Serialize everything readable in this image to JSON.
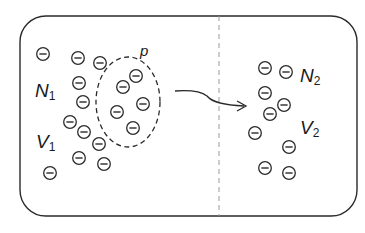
{
  "diagram": {
    "colors": {
      "stroke": "#2a2a2a",
      "divider": "#9a9a9a",
      "background": "#ffffff"
    },
    "container": {
      "x": 20,
      "y": 16,
      "width": 337,
      "height": 200,
      "radius": 26
    },
    "divider": {
      "x": 219,
      "y1": 16,
      "y2": 216,
      "style": "dashed"
    },
    "labels": {
      "N1": {
        "main": "N",
        "sub": "1"
      },
      "V1": {
        "main": "V",
        "sub": "1"
      },
      "N2": {
        "main": "N",
        "sub": "2"
      },
      "V2": {
        "main": "V",
        "sub": "2"
      },
      "p": "p"
    },
    "subset_region": {
      "label": "p",
      "cx": 128,
      "cy": 102,
      "rx": 32,
      "ry": 45,
      "style": "dashed"
    },
    "arrow": {
      "from": [
        175,
        91
      ],
      "to": [
        246,
        106
      ]
    },
    "particle_symbol": "⊖",
    "particles_left": [
      [
        43,
        54
      ],
      [
        78,
        58
      ],
      [
        100,
        63
      ],
      [
        79,
        83
      ],
      [
        83,
        102
      ],
      [
        70,
        122
      ],
      [
        84,
        132
      ],
      [
        99,
        144
      ],
      [
        79,
        158
      ],
      [
        104,
        164
      ],
      [
        50,
        173
      ]
    ],
    "particles_subset": [
      [
        136,
        76
      ],
      [
        123,
        87
      ],
      [
        143,
        104
      ],
      [
        117,
        112
      ],
      [
        133,
        128
      ]
    ],
    "particles_right": [
      [
        265,
        68
      ],
      [
        286,
        72
      ],
      [
        265,
        93
      ],
      [
        284,
        105
      ],
      [
        270,
        114
      ],
      [
        255,
        133
      ],
      [
        289,
        147
      ],
      [
        265,
        168
      ],
      [
        289,
        173
      ]
    ]
  }
}
